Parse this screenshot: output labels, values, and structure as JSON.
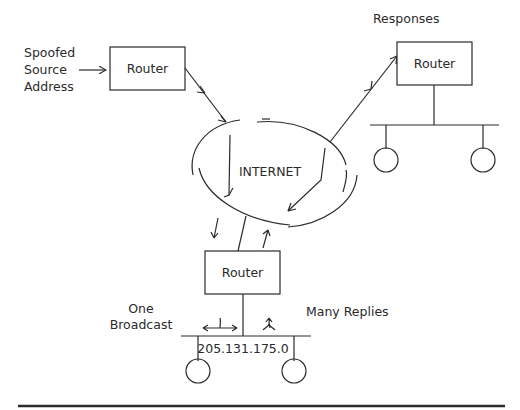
{
  "diagram": {
    "type": "smurf-attack-network",
    "labels": {
      "spoofed_source": [
        "Spoofed",
        "Source",
        "Address"
      ],
      "responses": "Responses",
      "internet": "INTERNET",
      "one_broadcast": [
        "One",
        "Broadcast"
      ],
      "many_replies": "Many Replies",
      "network_address": "205.131.175.0"
    },
    "routers": [
      {
        "id": "attacker-router",
        "label": "Router"
      },
      {
        "id": "victim-router",
        "label": "Router"
      },
      {
        "id": "amplifier-router",
        "label": "Router"
      }
    ],
    "hosts": [
      {
        "id": "victim-host-1",
        "network": "victim"
      },
      {
        "id": "victim-host-2",
        "network": "victim"
      },
      {
        "id": "amplifier-host-1",
        "network": "205.131.175.0"
      },
      {
        "id": "amplifier-host-2",
        "network": "205.131.175.0"
      }
    ],
    "colors": {
      "line": "#2a2a2a",
      "background": "#ffffff"
    }
  }
}
